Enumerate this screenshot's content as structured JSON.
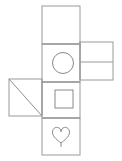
{
  "figure": {
    "background_color": "#ffffff",
    "line_color": "#9a9a9a",
    "shape_stroke_color": "#8a8a8a",
    "canvas": {
      "width": 122,
      "height": 161
    }
  },
  "faces": [
    {
      "id": "top-face",
      "name": "blank-top-face",
      "shape": "none",
      "label": "",
      "x": 42,
      "y": 6,
      "width": 38,
      "height": 38
    },
    {
      "id": "circle-face",
      "name": "circle-face",
      "shape": "circle",
      "label": "",
      "x": 42,
      "y": 44,
      "width": 38,
      "height": 38,
      "inner": {
        "cx": 63,
        "cy": 63,
        "r": 10.5
      }
    },
    {
      "id": "square-face",
      "name": "square-face",
      "shape": "square",
      "label": "",
      "x": 42,
      "y": 82,
      "width": 38,
      "height": 36,
      "inner": {
        "x": 55,
        "y": 90,
        "width": 18,
        "height": 18
      }
    },
    {
      "id": "heart-face",
      "name": "heart-face",
      "shape": "heart",
      "label": "",
      "x": 42,
      "y": 118,
      "width": 38,
      "height": 37
    },
    {
      "id": "left-face",
      "name": "diagonal-left-face",
      "shape": "diagonal",
      "label": "",
      "x": 9,
      "y": 79,
      "width": 33,
      "height": 37,
      "diagonal": {
        "x1": 9,
        "y1": 79,
        "x2": 42,
        "y2": 116
      }
    },
    {
      "id": "right-panel",
      "name": "divided-right-face",
      "shape": "divided-rectangle",
      "label": "",
      "x": 80,
      "y": 42,
      "width": 33,
      "height": 38,
      "divider": {
        "x1": 80,
        "y1": 62,
        "x2": 113,
        "y2": 62
      }
    }
  ],
  "fold_lines": [
    {
      "name": "fold-top-circle",
      "x1": 42,
      "y1": 44,
      "x2": 80,
      "y2": 44
    },
    {
      "name": "fold-circle-square",
      "x1": 42,
      "y1": 82,
      "x2": 80,
      "y2": 82
    },
    {
      "name": "fold-square-heart",
      "x1": 42,
      "y1": 118,
      "x2": 80,
      "y2": 118
    },
    {
      "name": "fold-left-center",
      "x1": 42,
      "y1": 79,
      "x2": 42,
      "y2": 116
    },
    {
      "name": "fold-center-right",
      "x1": 80,
      "y1": 42,
      "x2": 80,
      "y2": 80
    }
  ]
}
